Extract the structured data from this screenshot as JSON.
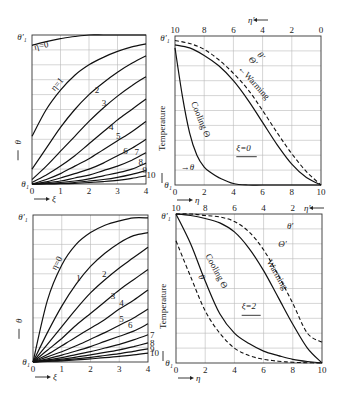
{
  "chart_data": [
    {
      "id": "top-left",
      "type": "line",
      "title": "",
      "xlabel": "ξ",
      "ylabel": "θ",
      "y_top_label": "θ′₁",
      "y_bottom_label": "θ₁",
      "xlim": [
        0,
        4
      ],
      "ylim": [
        0,
        1
      ],
      "x_ticks": [
        "0",
        "1",
        "2",
        "3",
        "4"
      ],
      "grid": true,
      "series": [
        {
          "name": "η=0",
          "label": "η=0",
          "x": [
            0,
            0.5,
            1,
            1.5,
            2,
            2.5,
            3,
            3.5,
            4
          ],
          "y": [
            0.93,
            0.955,
            0.975,
            0.99,
            1.0,
            1.0,
            1.0,
            1.0,
            1.0
          ]
        },
        {
          "name": "η=1",
          "label": "η=1",
          "x": [
            0,
            0.5,
            1,
            1.5,
            2,
            2.5,
            3,
            3.5,
            4
          ],
          "y": [
            0.32,
            0.5,
            0.63,
            0.73,
            0.8,
            0.85,
            0.89,
            0.92,
            0.94
          ]
        },
        {
          "name": "η=2",
          "label": "2",
          "x": [
            0,
            0.5,
            1,
            1.5,
            2,
            2.5,
            3,
            3.5,
            4
          ],
          "y": [
            0.1,
            0.24,
            0.38,
            0.5,
            0.6,
            0.68,
            0.75,
            0.81,
            0.86
          ]
        },
        {
          "name": "η=3",
          "label": "3",
          "x": [
            0,
            0.5,
            1,
            1.5,
            2,
            2.5,
            3,
            3.5,
            4
          ],
          "y": [
            0.03,
            0.12,
            0.22,
            0.32,
            0.42,
            0.51,
            0.59,
            0.66,
            0.72
          ]
        },
        {
          "name": "η=4",
          "label": "4",
          "x": [
            0,
            0.5,
            1,
            1.5,
            2,
            2.5,
            3,
            3.5,
            4
          ],
          "y": [
            0.01,
            0.06,
            0.12,
            0.19,
            0.27,
            0.35,
            0.43,
            0.5,
            0.57
          ]
        },
        {
          "name": "η=5",
          "label": "5",
          "x": [
            0,
            0.5,
            1,
            1.5,
            2,
            2.5,
            3,
            3.5,
            4
          ],
          "y": [
            0.0,
            0.03,
            0.07,
            0.12,
            0.17,
            0.23,
            0.29,
            0.35,
            0.42
          ]
        },
        {
          "name": "η=6",
          "label": "6",
          "x": [
            0,
            0.5,
            1,
            1.5,
            2,
            2.5,
            3,
            3.5,
            4
          ],
          "y": [
            0.0,
            0.015,
            0.04,
            0.07,
            0.1,
            0.14,
            0.19,
            0.24,
            0.3
          ]
        },
        {
          "name": "η=7",
          "label": "7",
          "x": [
            0,
            0.5,
            1,
            1.5,
            2,
            2.5,
            3,
            3.5,
            4
          ],
          "y": [
            0.0,
            0.008,
            0.02,
            0.04,
            0.06,
            0.09,
            0.12,
            0.16,
            0.21
          ]
        },
        {
          "name": "η=8",
          "label": "8",
          "x": [
            0,
            0.5,
            1,
            1.5,
            2,
            2.5,
            3,
            3.5,
            4
          ],
          "y": [
            0.0,
            0.004,
            0.01,
            0.02,
            0.035,
            0.055,
            0.075,
            0.1,
            0.14
          ]
        },
        {
          "name": "η=9",
          "label": "9",
          "x": [
            0,
            0.5,
            1,
            1.5,
            2,
            2.5,
            3,
            3.5,
            4
          ],
          "y": [
            0.0,
            0.002,
            0.005,
            0.01,
            0.02,
            0.03,
            0.045,
            0.065,
            0.09
          ]
        },
        {
          "name": "η=10",
          "label": "10",
          "x": [
            0,
            0.5,
            1,
            1.5,
            2,
            2.5,
            3,
            3.5,
            4
          ],
          "y": [
            0.0,
            0.001,
            0.002,
            0.005,
            0.01,
            0.016,
            0.025,
            0.038,
            0.055
          ]
        }
      ]
    },
    {
      "id": "top-right",
      "type": "line",
      "xlabel": "η",
      "x2label": "η′",
      "ylabel": "Temperature",
      "y_top_label": "θ′₁",
      "y_bottom_label": "θ₁",
      "xlim": [
        0,
        10
      ],
      "ylim": [
        0,
        1
      ],
      "x_ticks": [
        "0",
        "2",
        "4",
        "6",
        "8",
        "10"
      ],
      "x2_ticks": [
        "10",
        "8",
        "6",
        "4",
        "2",
        "0"
      ],
      "grid": true,
      "annotations": {
        "cooling": "Cooling",
        "cooling_symbol": "Θ",
        "warming": "Warming",
        "warming_symbol": "Θ′",
        "dashed_symbol": "θ′",
        "theta_arrow": "θ",
        "param": "ξ=0"
      },
      "series": [
        {
          "name": "Cooling Θ",
          "style": "solid",
          "x": [
            0,
            0.5,
            1,
            1.5,
            2,
            2.5,
            3,
            4,
            5,
            6,
            8,
            10
          ],
          "y": [
            0.92,
            0.6,
            0.35,
            0.2,
            0.12,
            0.08,
            0.05,
            0.01,
            0.0,
            0.0,
            0.0,
            0.0
          ]
        },
        {
          "name": "Warming Θ′",
          "style": "solid",
          "x": [
            0,
            1,
            2,
            3,
            4,
            5,
            6,
            7,
            8,
            9,
            10
          ],
          "y": [
            0.94,
            0.92,
            0.87,
            0.8,
            0.7,
            0.57,
            0.42,
            0.27,
            0.14,
            0.05,
            0.0
          ]
        },
        {
          "name": "θ′",
          "style": "dashed",
          "x": [
            0,
            1,
            2,
            3,
            4,
            5,
            6,
            7,
            8,
            9,
            10
          ],
          "y": [
            0.97,
            0.95,
            0.91,
            0.84,
            0.75,
            0.64,
            0.5,
            0.35,
            0.21,
            0.09,
            0.0
          ]
        }
      ]
    },
    {
      "id": "bottom-left",
      "type": "line",
      "xlabel": "ξ",
      "ylabel": "θ",
      "y_top_label": "θ′₁",
      "y_bottom_label": "θ₁",
      "xlim": [
        0,
        4
      ],
      "ylim": [
        0,
        1
      ],
      "x_ticks": [
        "0",
        "1",
        "2",
        "3",
        "4"
      ],
      "grid": true,
      "series": [
        {
          "name": "η=0",
          "label": "η=0",
          "x": [
            0,
            0.5,
            1,
            1.5,
            2,
            2.5,
            3,
            3.5,
            4
          ],
          "y": [
            0.0,
            0.42,
            0.66,
            0.8,
            0.88,
            0.93,
            0.96,
            0.98,
            0.98
          ]
        },
        {
          "name": "η=1",
          "label": "1",
          "x": [
            0,
            0.5,
            1,
            1.5,
            2,
            2.5,
            3,
            3.5,
            4
          ],
          "y": [
            0.0,
            0.2,
            0.38,
            0.53,
            0.65,
            0.74,
            0.81,
            0.86,
            0.88
          ]
        },
        {
          "name": "η=2",
          "label": "2",
          "x": [
            0,
            0.5,
            1,
            1.5,
            2,
            2.5,
            3,
            3.5,
            4
          ],
          "y": [
            0.0,
            0.12,
            0.24,
            0.36,
            0.47,
            0.56,
            0.64,
            0.71,
            0.78
          ]
        },
        {
          "name": "η=3",
          "label": "3",
          "x": [
            0,
            0.5,
            1,
            1.5,
            2,
            2.5,
            3,
            3.5,
            4
          ],
          "y": [
            0.0,
            0.08,
            0.16,
            0.25,
            0.33,
            0.41,
            0.49,
            0.56,
            0.63
          ]
        },
        {
          "name": "η=4",
          "label": "4",
          "x": [
            0,
            0.5,
            1,
            1.5,
            2,
            2.5,
            3,
            3.5,
            4
          ],
          "y": [
            0.0,
            0.05,
            0.11,
            0.17,
            0.23,
            0.29,
            0.36,
            0.42,
            0.49
          ]
        },
        {
          "name": "η=5",
          "label": "5",
          "x": [
            0,
            0.5,
            1,
            1.5,
            2,
            2.5,
            3,
            3.5,
            4
          ],
          "y": [
            0.0,
            0.035,
            0.07,
            0.11,
            0.155,
            0.2,
            0.25,
            0.3,
            0.36
          ]
        },
        {
          "name": "η=6",
          "label": "6",
          "x": [
            0,
            0.5,
            1,
            1.5,
            2,
            2.5,
            3,
            3.5,
            4
          ],
          "y": [
            0.0,
            0.022,
            0.047,
            0.075,
            0.105,
            0.14,
            0.175,
            0.21,
            0.26
          ]
        },
        {
          "name": "η=7",
          "label": "7",
          "x": [
            0,
            0.5,
            1,
            1.5,
            2,
            2.5,
            3,
            3.5,
            4
          ],
          "y": [
            0.0,
            0.014,
            0.03,
            0.05,
            0.07,
            0.095,
            0.12,
            0.15,
            0.185
          ]
        },
        {
          "name": "η=8",
          "label": "8",
          "x": [
            0,
            0.5,
            1,
            1.5,
            2,
            2.5,
            3,
            3.5,
            4
          ],
          "y": [
            0.0,
            0.009,
            0.02,
            0.033,
            0.048,
            0.065,
            0.083,
            0.105,
            0.13
          ]
        },
        {
          "name": "η=9",
          "label": "9",
          "x": [
            0,
            0.5,
            1,
            1.5,
            2,
            2.5,
            3,
            3.5,
            4
          ],
          "y": [
            0.0,
            0.006,
            0.013,
            0.022,
            0.032,
            0.044,
            0.057,
            0.072,
            0.09
          ]
        },
        {
          "name": "η=10",
          "label": "10",
          "x": [
            0,
            0.5,
            1,
            1.5,
            2,
            2.5,
            3,
            3.5,
            4
          ],
          "y": [
            0.0,
            0.004,
            0.008,
            0.014,
            0.021,
            0.029,
            0.038,
            0.048,
            0.06
          ]
        }
      ]
    },
    {
      "id": "bottom-right",
      "type": "line",
      "xlabel": "η",
      "x2label": "η′",
      "ylabel": "Temperature",
      "y_top_label": "θ′₁",
      "y_bottom_label": "θ₁",
      "xlim": [
        0,
        10
      ],
      "ylim": [
        0,
        1
      ],
      "x_ticks": [
        "0",
        "2",
        "4",
        "6",
        "8",
        "10"
      ],
      "x2_ticks": [
        "10",
        "8",
        "6",
        "4",
        "2"
      ],
      "grid": true,
      "annotations": {
        "cooling": "Cooling",
        "cooling_symbol": "Θ",
        "warming": "Warming",
        "warming_symbol": "Θ′",
        "dashed_top_symbol": "θ′",
        "dashed_bottom_symbol": "θ",
        "param": "ξ=2"
      },
      "series": [
        {
          "name": "Cooling Θ",
          "style": "solid",
          "x": [
            0,
            1,
            2,
            3,
            4,
            5,
            6,
            7,
            8,
            9,
            10
          ],
          "y": [
            1.0,
            0.8,
            0.55,
            0.33,
            0.2,
            0.13,
            0.08,
            0.05,
            0.025,
            0.01,
            0.0
          ]
        },
        {
          "name": "θ",
          "style": "dashed",
          "x": [
            0,
            1,
            2,
            3,
            4,
            5,
            6,
            7,
            8,
            9,
            10
          ],
          "y": [
            0.82,
            0.58,
            0.35,
            0.2,
            0.1,
            0.05,
            0.025,
            0.012,
            0.005,
            0.002,
            0.0
          ]
        },
        {
          "name": "Warming Θ′",
          "style": "solid",
          "x": [
            0,
            1,
            2,
            3,
            4,
            5,
            6,
            7,
            8,
            9,
            10
          ],
          "y": [
            1.0,
            0.99,
            0.97,
            0.94,
            0.88,
            0.77,
            0.62,
            0.44,
            0.26,
            0.1,
            0.0
          ]
        },
        {
          "name": "θ′",
          "style": "dashed",
          "x": [
            0,
            1,
            2,
            3,
            4,
            5,
            6,
            7,
            8,
            9,
            10
          ],
          "y": [
            1.0,
            1.0,
            0.99,
            0.98,
            0.95,
            0.88,
            0.76,
            0.59,
            0.4,
            0.2,
            0.14
          ]
        }
      ]
    }
  ]
}
